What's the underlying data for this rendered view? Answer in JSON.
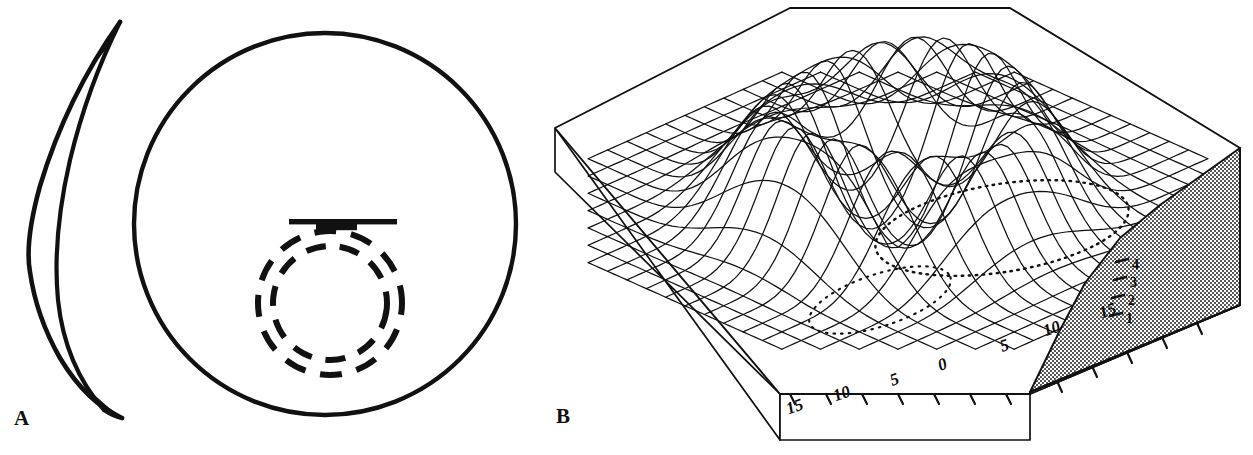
{
  "figure": {
    "background_color": "#ffffff",
    "ink_color": "#111111",
    "width": 1253,
    "height": 455
  },
  "panels": [
    {
      "id": "A",
      "label": "A",
      "description": "Schematic of cornea: lateral crescent profile and frontal circular view with concentric dashed rings and a horizontal scale bar",
      "elements": {
        "crescent_name": "corneal-profile-crescent",
        "circle_name": "corneal-frontal-circle",
        "dashed_rings_name": "dashed-ring",
        "bar_name": "scale-bar"
      }
    },
    {
      "id": "B",
      "label": "B",
      "description": "Three-dimensional wire-mesh surface plot of corneal curvature showing an annular ridge with a central crater-like depression, drawn on an octagonal plinth",
      "elements": {
        "mesh_name": "surface-mesh",
        "plinth_name": "base-plinth",
        "stipple_name": "stippled-side-wall",
        "contour_name": "dotted-basin-contour"
      }
    }
  ],
  "chart_data": {
    "type": "surface",
    "title": "",
    "subtitle": "",
    "xlabel": "",
    "ylabel": "",
    "zlabel": "",
    "projection": "isometric-wireframe",
    "grid": true,
    "legend": "none",
    "x_tick_labels": [
      "15",
      "10",
      "5",
      "0",
      "5",
      "10",
      "15"
    ],
    "x_tick_values": [
      -15,
      -10,
      -5,
      0,
      5,
      10,
      15
    ],
    "y_tick_labels": [
      "15",
      "10",
      "5",
      "0",
      "5",
      "10",
      "15"
    ],
    "y_tick_values": [
      -15,
      -10,
      -5,
      0,
      5,
      10,
      15
    ],
    "z_tick_labels": [
      "1",
      "2",
      "3",
      "4"
    ],
    "z_tick_values": [
      1,
      2,
      3,
      4
    ],
    "xlim": [
      -15,
      15
    ],
    "ylim": [
      -15,
      15
    ],
    "zlim": [
      0,
      4
    ],
    "mesh_divisions": 22,
    "surface_model": {
      "form": "annular-ridge-with-central-depression",
      "ridge_radius": 6.2,
      "ridge_height": 4.0,
      "central_depression_depth": 1.4,
      "plateau_height": 0.05,
      "falloff_sigma": 3.1
    },
    "annotations": [
      {
        "name": "dotted-basin-contour",
        "text": "",
        "value": 1.2
      }
    ]
  },
  "axis_labels": {
    "horizontal": [
      {
        "text": "15",
        "x": 786,
        "y": 398,
        "rot": -20
      },
      {
        "text": "10",
        "x": 833,
        "y": 385,
        "rot": -20
      },
      {
        "text": "5",
        "x": 890,
        "y": 371,
        "rot": -20
      },
      {
        "text": "0",
        "x": 938,
        "y": 356,
        "rot": -20
      },
      {
        "text": "5",
        "x": 1000,
        "y": 337,
        "rot": -20
      },
      {
        "text": "10",
        "x": 1043,
        "y": 320,
        "rot": -20
      },
      {
        "text": "15",
        "x": 1099,
        "y": 302,
        "rot": -20
      }
    ],
    "vertical": [
      {
        "text": "4",
        "x": 1132,
        "y": 258
      },
      {
        "text": "3",
        "x": 1130,
        "y": 276
      },
      {
        "text": "2",
        "x": 1128,
        "y": 294
      },
      {
        "text": "1",
        "x": 1126,
        "y": 312
      }
    ]
  }
}
